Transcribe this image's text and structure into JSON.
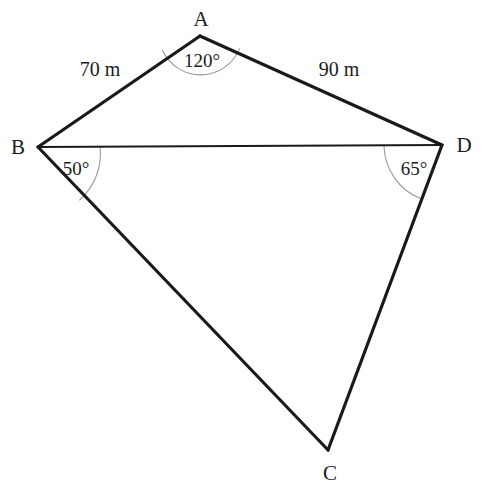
{
  "figure": {
    "background_color": "#ffffff",
    "line_color": "#1a1a1a",
    "arc_color": "#9a9a9a",
    "text_color": "#1b1b1b",
    "width": 482,
    "height": 492
  },
  "vertices": [
    {
      "name": "A",
      "label": "A",
      "x": 200,
      "y": 36,
      "label_x": 201,
      "label_y": 19
    },
    {
      "name": "B",
      "label": "B",
      "x": 38,
      "y": 147,
      "label_x": 18,
      "label_y": 147
    },
    {
      "name": "C",
      "label": "C",
      "x": 328,
      "y": 450,
      "label_x": 330,
      "label_y": 473
    },
    {
      "name": "D",
      "label": "D",
      "x": 442,
      "y": 145,
      "label_x": 464,
      "label_y": 145
    }
  ],
  "edges": [
    {
      "name": "edge-B-A",
      "from": "B",
      "to": "A",
      "stroke_width": 3.2
    },
    {
      "name": "edge-A-D",
      "from": "A",
      "to": "D",
      "stroke_width": 3.2
    },
    {
      "name": "edge-B-D",
      "from": "B",
      "to": "D",
      "stroke_width": 2.2
    },
    {
      "name": "edge-B-C",
      "from": "B",
      "to": "C",
      "stroke_width": 3.2
    },
    {
      "name": "edge-D-C",
      "from": "D",
      "to": "C",
      "stroke_width": 3.2
    }
  ],
  "side_labels": [
    {
      "name": "side-label-AB",
      "text": "70 m",
      "x": 100,
      "y": 69
    },
    {
      "name": "side-label-AD",
      "text": "90 m",
      "x": 339,
      "y": 69
    }
  ],
  "angle_marks": [
    {
      "name": "angle-A",
      "vertex": "A",
      "text": "120°",
      "value": 120,
      "radius": 42,
      "label_x": 202,
      "label_y": 60,
      "path": "M 162.3 50.1 A 42 42 0 0 0 239.6 48.4"
    },
    {
      "name": "angle-B",
      "vertex": "B",
      "text": "50°",
      "value": 50,
      "radius": 62,
      "label_x": 76,
      "label_y": 168,
      "path": "M 100 146.2 A 62 62 0 0 1 79.3 200.3"
    },
    {
      "name": "angle-D",
      "vertex": "D",
      "text": "65°",
      "value": 65,
      "radius": 58,
      "label_x": 414,
      "label_y": 168,
      "path": "M 384 145.6 A 58 58 0 0 0 420.5 198.5"
    }
  ],
  "chart_data": {
    "type": "diagram",
    "shape": "quadrilateral",
    "vertices": [
      "A",
      "B",
      "C",
      "D"
    ],
    "sides": [
      {
        "side": "AB",
        "length": 70,
        "unit": "m",
        "label": "70 m"
      },
      {
        "side": "AD",
        "length": 90,
        "unit": "m",
        "label": "90 m"
      },
      {
        "side": "BD",
        "length": null,
        "unit": "m",
        "label": ""
      },
      {
        "side": "BC",
        "length": null,
        "unit": "m",
        "label": ""
      },
      {
        "side": "DC",
        "length": null,
        "unit": "m",
        "label": ""
      }
    ],
    "angles": [
      {
        "at": "A",
        "between": "BAD",
        "degrees": 120,
        "label": "120°"
      },
      {
        "at": "B",
        "between": "DBC",
        "degrees": 50,
        "label": "50°"
      },
      {
        "at": "D",
        "between": "BDC",
        "degrees": 65,
        "label": "65°"
      }
    ]
  }
}
